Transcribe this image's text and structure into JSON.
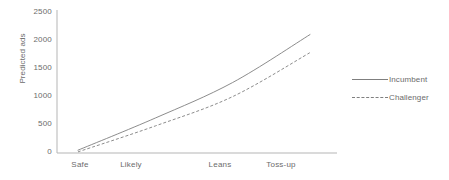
{
  "chart_data": {
    "type": "line",
    "title": "",
    "xlabel": "",
    "ylabel": "Predicted ads",
    "categories": [
      "Safe",
      "Likely",
      "Leans",
      "Toss-up"
    ],
    "yticks": [
      0,
      500,
      1000,
      1500,
      2000,
      2500
    ],
    "ytick_labels": [
      "0",
      "500",
      "1000",
      "1500",
      "2000",
      "2500"
    ],
    "ylim": [
      0,
      2500
    ],
    "grid": false,
    "legend_position": "right",
    "series": [
      {
        "name": "Incumbent",
        "style": "solid",
        "color": "#7f7f7f",
        "values": [
          50,
          620,
          1250,
          2100
        ]
      },
      {
        "name": "Challenger",
        "style": "dashed",
        "color": "#7f7f7f",
        "values": [
          20,
          480,
          1000,
          1780
        ]
      }
    ]
  },
  "axis": {
    "y_title": "Predicted ads",
    "y_tick_0": "0",
    "y_tick_1": "500",
    "y_tick_2": "1000",
    "y_tick_3": "1500",
    "y_tick_4": "2000",
    "y_tick_5": "2500",
    "x_tick_0": "Safe",
    "x_tick_1": "Likely",
    "x_tick_2": "Leans",
    "x_tick_3": "Toss-up"
  },
  "legend": {
    "items": [
      {
        "label": "Incumbent",
        "style": "solid"
      },
      {
        "label": "Challenger",
        "style": "dashed"
      }
    ]
  },
  "colors": {
    "line": "#7f7f7f",
    "axis": "#b5b5b5",
    "text": "#6b6b6b",
    "background": "#ffffff"
  }
}
